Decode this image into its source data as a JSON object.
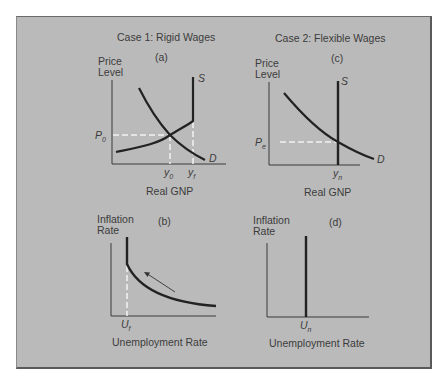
{
  "figure": {
    "cases": [
      {
        "title": "Case 1: Rigid Wages",
        "panels": [
          {
            "id": "a",
            "label": "(a)",
            "y_axis_label": [
              "Price",
              "Level"
            ],
            "x_axis_label": "Real GNP",
            "curves": [
              {
                "name": "S",
                "label": "S",
                "description": "upward-sloping then vertical supply curve"
              },
              {
                "name": "D",
                "label": "D",
                "description": "downward-sloping demand curve"
              }
            ],
            "price_marker": "P0",
            "price_marker_main": "P",
            "price_marker_sub": "0",
            "x_markers": [
              {
                "main": "y",
                "sub": "0"
              },
              {
                "main": "y",
                "sub": "f"
              }
            ]
          },
          {
            "id": "b",
            "label": "(b)",
            "y_axis_label": [
              "Inflation",
              "Rate"
            ],
            "x_axis_label": "Unemployment Rate",
            "curves": [
              {
                "name": "phillips",
                "description": "downward-sloping curve, vertical at Uf"
              }
            ],
            "x_markers": [
              {
                "main": "U",
                "sub": "f"
              }
            ],
            "arrow": "movement up along curve toward Uf"
          }
        ]
      },
      {
        "title": "Case 2: Flexible Wages",
        "panels": [
          {
            "id": "c",
            "label": "(c)",
            "y_axis_label": [
              "Price",
              "Level"
            ],
            "x_axis_label": "Real GNP",
            "curves": [
              {
                "name": "S",
                "label": "S",
                "description": "vertical supply curve at yn"
              },
              {
                "name": "D",
                "label": "D",
                "description": "downward-sloping demand curve"
              }
            ],
            "price_marker": "Pe",
            "price_marker_main": "P",
            "price_marker_sub": "e",
            "x_markers": [
              {
                "main": "y",
                "sub": "n"
              }
            ]
          },
          {
            "id": "d",
            "label": "(d)",
            "y_axis_label": [
              "Inflation",
              "Rate"
            ],
            "x_axis_label": "Unemployment Rate",
            "curves": [
              {
                "name": "vertical",
                "description": "vertical line at Un"
              }
            ],
            "x_markers": [
              {
                "main": "U",
                "sub": "n"
              }
            ]
          }
        ]
      }
    ]
  },
  "colors": {
    "background": "#bababa",
    "curve": "#222222",
    "axis": "#3a3a3a",
    "dashed_guide": "#f2f2f2",
    "text": "#3c3c3c"
  }
}
